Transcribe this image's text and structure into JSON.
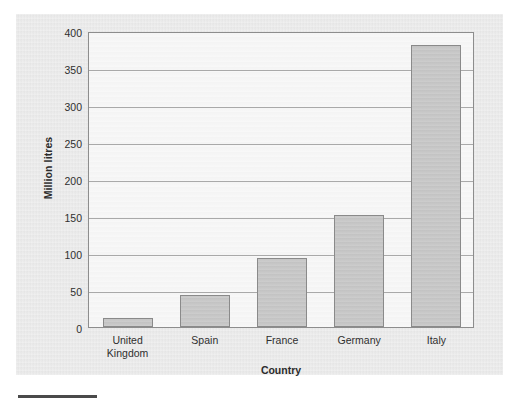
{
  "chart_data": {
    "type": "bar",
    "title": "",
    "xlabel": "Country",
    "ylabel": "Million litres",
    "categories": [
      "United\nKingdom",
      "Spain",
      "France",
      "Germany",
      "Italy"
    ],
    "values": [
      12,
      43,
      93,
      151,
      381
    ],
    "ylim": [
      0,
      400
    ],
    "ytick_labels": [
      "400",
      "350",
      "300",
      "250",
      "200",
      "150",
      "100",
      "50",
      "0"
    ],
    "ytick_values": [
      400,
      350,
      300,
      250,
      200,
      150,
      100,
      50,
      0
    ],
    "ystep": 50,
    "grid": true,
    "legend": "none",
    "bar_fill_color": "#c6c6c6",
    "bar_border_color": "#8a8a8a",
    "plot_background_color": "#f5f5f5",
    "panel_background_color": "#e9e9e9",
    "gridline_color": "#a9a9a9",
    "axis_color": "#8d8d8d",
    "text_color": "#2f2f2f"
  }
}
